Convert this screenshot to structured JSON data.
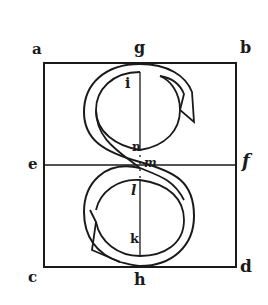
{
  "diagram": {
    "labels": {
      "a": "a",
      "b": "b",
      "g": "g",
      "e": "e",
      "f": "f",
      "c": "c",
      "d": "d",
      "h": "h",
      "i": "i",
      "n": "n",
      "m": "m",
      "l": "l",
      "k": "k"
    },
    "colors": {
      "ink": "#1a1a1a",
      "background": "#ffffff"
    }
  }
}
